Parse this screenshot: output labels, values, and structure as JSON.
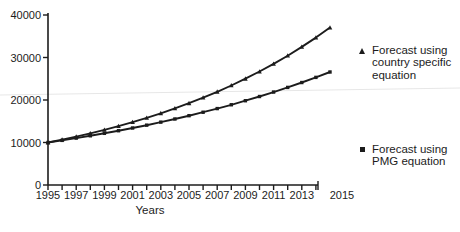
{
  "figure": {
    "xlabel": "Years",
    "background": "#ffffff",
    "ink_color": "#1c1c1c"
  },
  "legend": {
    "items": [
      {
        "marker": "triangle-marker-icon",
        "label": "Forecast using\ncountry specific\nequation"
      },
      {
        "marker": "square-marker-icon",
        "label": "Forecast using\nPMG equation"
      }
    ]
  },
  "chart_data": {
    "type": "line",
    "title": "",
    "xlabel": "Years",
    "ylabel": "",
    "xlim": [
      1995,
      2015
    ],
    "ylim": [
      0,
      40000
    ],
    "grid": false,
    "legend_position": "right",
    "yticks": [
      0,
      10000,
      20000,
      30000,
      40000
    ],
    "xticks_minor_every_year": true,
    "xtick_labels": [
      1995,
      1997,
      1999,
      2001,
      2003,
      2005,
      2007,
      2009,
      2011,
      2013,
      2015
    ],
    "x": [
      1995,
      1996,
      1997,
      1998,
      1999,
      2000,
      2001,
      2002,
      2003,
      2004,
      2005,
      2006,
      2007,
      2008,
      2009,
      2010,
      2011,
      2012,
      2013,
      2014,
      2015
    ],
    "series": [
      {
        "name": "Forecast using country specific equation",
        "marker": "triangle",
        "values": [
          10000,
          10680,
          11400,
          12170,
          12990,
          13870,
          14810,
          15810,
          16880,
          18020,
          19240,
          20550,
          21940,
          23420,
          25000,
          26700,
          28500,
          30430,
          32490,
          34690,
          37030
        ]
      },
      {
        "name": "Forecast using PMG equation",
        "marker": "square",
        "values": [
          10000,
          10500,
          11030,
          11580,
          12160,
          12770,
          13410,
          14080,
          14790,
          15530,
          16310,
          17120,
          17980,
          18880,
          19830,
          20820,
          21870,
          22960,
          24110,
          25320,
          26590
        ]
      }
    ]
  }
}
